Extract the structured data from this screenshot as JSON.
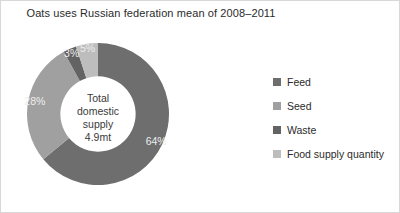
{
  "chart_data": {
    "type": "pie",
    "variant": "donut",
    "title": "Oats uses Russian federation mean of 2008–2011",
    "categories": [
      "Feed",
      "Seed",
      "Waste",
      "Food supply quantity"
    ],
    "values": [
      64,
      28,
      3,
      5
    ],
    "value_unit": "%",
    "data_labels": [
      "64%",
      "28%",
      "3%",
      "5%"
    ],
    "colors": [
      "#6e6e6e",
      "#a0a0a0",
      "#636363",
      "#bdbdbd"
    ],
    "start_angle_deg": 0,
    "direction": "clockwise",
    "inner_radius_ratio": 0.53,
    "legend_position": "right",
    "grid": false,
    "center_annotation": {
      "line1": "Total",
      "line2": "domestic",
      "line3": "supply",
      "line4": "4.9mt"
    }
  },
  "legend": {
    "items": [
      {
        "label": "Feed",
        "color": "#6e6e6e"
      },
      {
        "label": "Seed",
        "color": "#a0a0a0"
      },
      {
        "label": "Waste",
        "color": "#636363"
      },
      {
        "label": "Food supply quantity",
        "color": "#bdbdbd"
      }
    ]
  }
}
